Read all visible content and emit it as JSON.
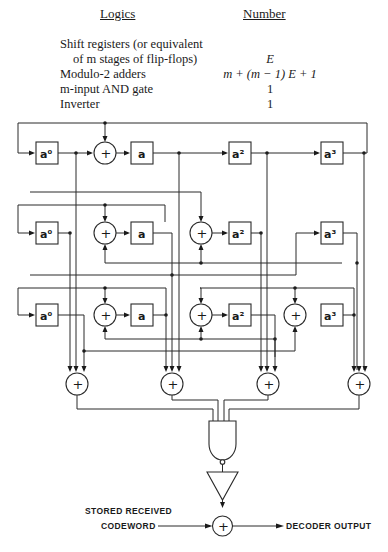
{
  "table": {
    "header_logics": "Logics",
    "header_number": "Number",
    "rows": [
      {
        "logic": "Shift registers (or equivalent",
        "number": ""
      },
      {
        "logic": "of m stages of flip-flops)",
        "number": "E"
      },
      {
        "logic": "Modulo-2 adders",
        "number": "m + (m − 1) E + 1"
      },
      {
        "logic": "m-input AND gate",
        "number": "1"
      },
      {
        "logic": "Inverter",
        "number": "1"
      }
    ]
  },
  "diagram": {
    "register_labels": {
      "a0": "a⁰",
      "a1": "a",
      "a2": "a²",
      "a3": "a³"
    },
    "adder_symbol": "+",
    "input_label_line1": "STORED RECEIVED",
    "input_label_line2": "CODEWORD",
    "output_label": "DECODER OUTPUT"
  }
}
